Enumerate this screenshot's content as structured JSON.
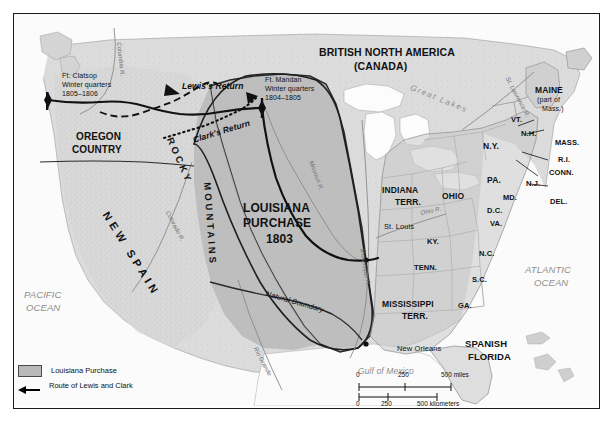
{
  "map": {
    "title_regions": {
      "british_north_america": "BRITISH NORTH AMERICA",
      "canada": "(CANADA)",
      "oregon_country_l1": "OREGON",
      "oregon_country_l2": "COUNTRY",
      "louisiana_l1": "LOUISIANA",
      "louisiana_l2": "PURCHASE",
      "louisiana_year": "1803",
      "new_spain_text": "NEW SPAIN",
      "rocky_text": "ROCKY",
      "mountains_text": "MOUNTAINS",
      "spanish_florida_l1": "SPANISH",
      "spanish_florida_l2": "FLORIDA",
      "indiana_l1": "INDIANA",
      "indiana_l2": "TERR.",
      "mississippi_l1": "MISSISSIPPI",
      "mississippi_l2": "TERR.",
      "maine_l1": "MAINE",
      "maine_l2": "(part of",
      "maine_l3": "Mass.)"
    },
    "oceans": {
      "pacific_l1": "PACIFIC",
      "pacific_l2": "OCEAN",
      "atlantic_l1": "ATLANTIC",
      "atlantic_l2": "OCEAN",
      "gulf": "Gulf of Mexico",
      "great_lakes": "Great Lakes"
    },
    "states": [
      {
        "name": "OHIO",
        "abbr": "OHIO"
      },
      {
        "name": "Kentucky",
        "abbr": "KY."
      },
      {
        "name": "Tennessee",
        "abbr": "TENN."
      },
      {
        "name": "Georgia",
        "abbr": "GA."
      },
      {
        "name": "South Carolina",
        "abbr": "S.C."
      },
      {
        "name": "North Carolina",
        "abbr": "N.C."
      },
      {
        "name": "Virginia",
        "abbr": "VA."
      },
      {
        "name": "District of Columbia",
        "abbr": "D.C."
      },
      {
        "name": "Maryland",
        "abbr": "MD."
      },
      {
        "name": "Delaware",
        "abbr": "DEL."
      },
      {
        "name": "New Jersey",
        "abbr": "N.J."
      },
      {
        "name": "Pennsylvania",
        "abbr": "PA."
      },
      {
        "name": "New York",
        "abbr": "N.Y."
      },
      {
        "name": "Connecticut",
        "abbr": "CONN."
      },
      {
        "name": "Rhode Island",
        "abbr": "R.I."
      },
      {
        "name": "Massachusetts",
        "abbr": "MASS."
      },
      {
        "name": "New Hampshire",
        "abbr": "N.H."
      },
      {
        "name": "Vermont",
        "abbr": "VT."
      }
    ],
    "rivers": [
      {
        "label": "Columbia R."
      },
      {
        "label": "Missouri R."
      },
      {
        "label": "Mississippi R."
      },
      {
        "label": "Ohio R."
      },
      {
        "label": "Colorado R."
      },
      {
        "label": "Rio Grande"
      },
      {
        "label": "St. Lawrence R."
      }
    ],
    "river_labels": {
      "columbia": "Columbia R.",
      "missouri": "Missouri R.",
      "mississippi": "Mississippi R.",
      "ohio": "Ohio R.",
      "colorado": "Colorado R.",
      "rio_grande": "Rio Grande",
      "st_lawrence": "St. Lawrence R."
    },
    "cities": [
      {
        "name": "St. Louis"
      },
      {
        "name": "New Orleans"
      }
    ],
    "city_labels": {
      "st_louis": "St. Louis",
      "new_orleans": "New Orleans"
    },
    "annotations": {
      "ft_clatsop_l1": "Ft. Clatsop",
      "ft_clatsop_l2": "Winter quarters",
      "ft_clatsop_l3": "1805–1806",
      "ft_mandan_l1": "Ft. Mandan",
      "ft_mandan_l2": "Winter quarters",
      "ft_mandan_l3": "1804–1805",
      "lewis_return": "Lewis's Return",
      "clarks_return": "Clark's Return",
      "natural_boundary": "Natural Boundary"
    },
    "legend": {
      "purchase_label": "Louisiana Purchase",
      "route_label": "Route of Lewis and Clark",
      "purchase_color": "#b9b9b9",
      "route_color": "#000000"
    },
    "scale": {
      "miles_zero": "0",
      "miles_mid": "250",
      "miles_end": "500 miles",
      "km_zero": "0",
      "km_mid": "250",
      "km_end": "500 kilometers"
    }
  }
}
